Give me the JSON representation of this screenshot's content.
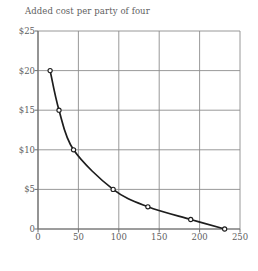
{
  "chart_data": {
    "type": "line",
    "title": "Added cost per party of four",
    "xlabel": "Total party attendance (thousands)",
    "ylabel": "",
    "xlim": [
      0,
      250
    ],
    "ylim": [
      0,
      25
    ],
    "grid": true,
    "legend": "none",
    "x_ticks": [
      "0",
      "50",
      "100",
      "150",
      "200",
      "250"
    ],
    "x_tick_values": [
      0,
      50,
      100,
      150,
      200,
      250
    ],
    "y_ticks": [
      "0",
      "$5",
      "$10",
      "$15",
      "$20",
      "$25"
    ],
    "y_tick_values": [
      0,
      5,
      10,
      15,
      20,
      25
    ],
    "marker": "open-circle",
    "series": [
      {
        "name": "Added cost per party of four",
        "x": [
          15,
          26,
          44,
          93,
          136,
          189,
          231
        ],
        "y": [
          20,
          15,
          10,
          5,
          2.8,
          1.2,
          0
        ]
      }
    ]
  },
  "colors": {
    "grid": "#8d8d8d",
    "axis": "#6f6f6f",
    "curve": "#1d1d1d",
    "text": "#5e5e5e",
    "background": "#ffffff",
    "marker_fill": "#ffffff"
  }
}
